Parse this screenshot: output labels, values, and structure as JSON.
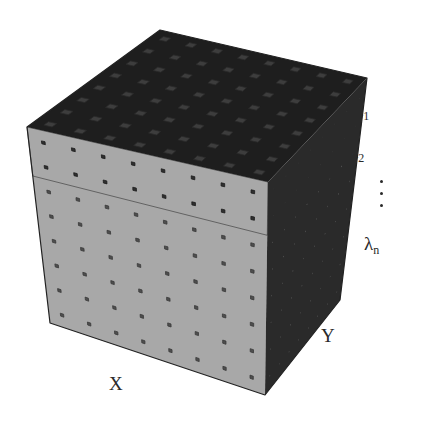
{
  "diagram": {
    "type": "hyperspectral-data-cube",
    "grid": {
      "x_count": 8,
      "y_count": 8,
      "layers": 8,
      "dark_top_layers": 2
    },
    "colors": {
      "background": "#ffffff",
      "top_face": "#3d3d3d",
      "top_gap": "#1e1e1e",
      "front_dark": "#2f2f2f",
      "front_mid": "#4e4e4e",
      "front_separator": "#a8a8a8",
      "side_dark": "#2a2a2a",
      "side_light": "#a6a6a6",
      "text": "#2a2a2a"
    },
    "spectral_labels": [
      {
        "symbol": "λ",
        "sub": "1"
      },
      {
        "symbol": "λ",
        "sub": "2"
      },
      {
        "symbol": "λ",
        "sub": "n"
      }
    ],
    "ellipsis": "⋮",
    "axes": {
      "x_label": "X",
      "y_label": "Y"
    }
  }
}
